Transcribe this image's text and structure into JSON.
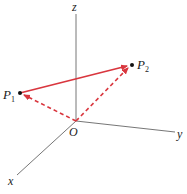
{
  "diagram": {
    "type": "3d-vector-diagram",
    "axes": {
      "x_label": "x",
      "y_label": "y",
      "z_label": "z",
      "color": "#555555"
    },
    "origin": {
      "label": "O"
    },
    "points": [
      {
        "id": "P1",
        "label": "P",
        "subscript": "1"
      },
      {
        "id": "P2",
        "label": "P",
        "subscript": "2"
      }
    ],
    "vectors": [
      {
        "from": "P1",
        "to": "P2",
        "style": "solid",
        "color": "#d9363e"
      },
      {
        "from": "O",
        "to": "P1",
        "style": "dashed",
        "color": "#d9363e"
      },
      {
        "from": "O",
        "to": "P2",
        "style": "dashed",
        "color": "#d9363e"
      }
    ]
  }
}
